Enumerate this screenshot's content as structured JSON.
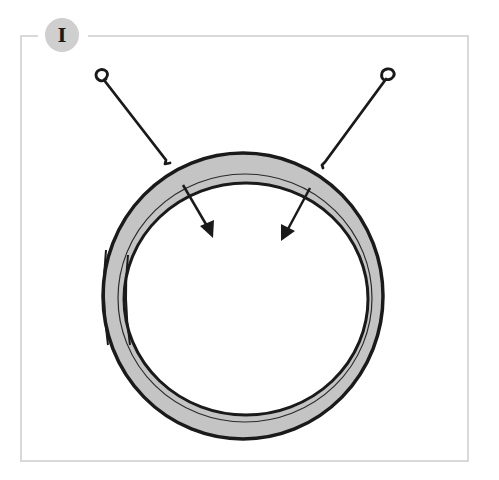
{
  "step": {
    "number_label": "I"
  },
  "illustration": {
    "description": "Ring with two wire hooks and two inward arrows",
    "colors": {
      "frame": "#d9d9d9",
      "badge": "#cfcfcf",
      "ring_fill": "#c4c4c4",
      "ink": "#1a1a1a"
    },
    "elements": [
      "ring",
      "left-hook",
      "right-hook",
      "left-arrow",
      "right-arrow"
    ]
  }
}
